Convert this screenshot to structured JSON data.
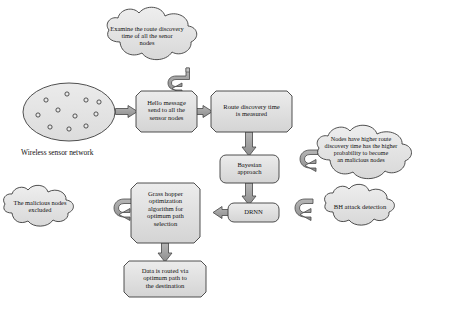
{
  "diagram": {
    "palette": {
      "fill_light": "#e3e3e3",
      "fill_mid": "#d2d2d2",
      "fill_dark": "#c0c0c0",
      "stroke": "#3c3c3c",
      "arrow_fill": "#9a9a9a",
      "text": "#111111",
      "page_bg": "#ffffff"
    },
    "network": {
      "shape": "ellipse",
      "caption": "Wireless sensor network",
      "node_count": 11,
      "nodes": [
        {
          "cx": 46,
          "cy": 100
        },
        {
          "cx": 67,
          "cy": 94
        },
        {
          "cx": 86,
          "cy": 100
        },
        {
          "cx": 99,
          "cy": 102
        },
        {
          "cx": 38,
          "cy": 115
        },
        {
          "cx": 58,
          "cy": 110
        },
        {
          "cx": 75,
          "cy": 116
        },
        {
          "cx": 96,
          "cy": 114
        },
        {
          "cx": 50,
          "cy": 127
        },
        {
          "cx": 69,
          "cy": 129
        },
        {
          "cx": 86,
          "cy": 126
        }
      ]
    },
    "clouds": [
      {
        "id": "examine-cloud",
        "name": "examine-route-discovery-cloud",
        "lines": [
          "Examine the route discovery",
          "time of all the senor",
          "nodes"
        ]
      },
      {
        "id": "higher-route-cloud",
        "name": "higher-route-discovery-cloud",
        "lines": [
          "Nodes have higher route",
          "discovery time has the higher",
          "probability to become",
          "an malicious nodes"
        ]
      },
      {
        "id": "bh-cloud",
        "name": "bh-attack-detection-cloud",
        "lines": [
          "BH attack detection"
        ]
      },
      {
        "id": "excluded-cloud",
        "name": "malicious-nodes-excluded-cloud",
        "lines": [
          "The malicious nodes",
          "excluded"
        ]
      }
    ],
    "process_boxes": [
      {
        "id": "hello-box",
        "name": "hello-message-box",
        "shape": "octagon",
        "lines": [
          "Hello message",
          "send to all the",
          "sensor nodes"
        ]
      },
      {
        "id": "route-box",
        "name": "route-discovery-time-box",
        "shape": "octagon",
        "lines": [
          "Route discovery time",
          "is measured"
        ]
      },
      {
        "id": "bayesian-box",
        "name": "bayesian-approach-box",
        "shape": "rounded-rect",
        "lines": [
          "Bayesian",
          "approach"
        ]
      },
      {
        "id": "drnn-box",
        "name": "drnn-box",
        "shape": "rounded-rect",
        "lines": [
          "DRNN"
        ]
      },
      {
        "id": "gho-box",
        "name": "grasshopper-optimization-box",
        "shape": "octagon",
        "lines": [
          "Grass hopper",
          "optimization",
          "algorithm for",
          "optimum path",
          "selection"
        ]
      },
      {
        "id": "routed-box",
        "name": "data-routed-box",
        "shape": "octagon",
        "lines": [
          "Data is routed via",
          "optimum path to",
          "the destination"
        ]
      }
    ],
    "connectors": [
      {
        "name": "arrow-network-to-hello",
        "kind": "straight",
        "direction": "right"
      },
      {
        "name": "arrow-hello-to-route",
        "kind": "straight",
        "direction": "right"
      },
      {
        "name": "arrow-examine-to-hello",
        "kind": "curved",
        "direction": "down-left"
      },
      {
        "name": "arrow-route-to-bayesian",
        "kind": "straight",
        "direction": "down"
      },
      {
        "name": "arrow-bayesian-to-drnn",
        "kind": "straight",
        "direction": "down"
      },
      {
        "name": "arrow-higher-route-to-bayesian",
        "kind": "curved",
        "direction": "left"
      },
      {
        "name": "arrow-bh-to-drnn",
        "kind": "curved",
        "direction": "left"
      },
      {
        "name": "arrow-drnn-to-grasshopper",
        "kind": "straight",
        "direction": "left"
      },
      {
        "name": "arrow-grasshopper-to-excluded",
        "kind": "curved",
        "direction": "left"
      },
      {
        "name": "arrow-grasshopper-to-routed",
        "kind": "straight",
        "direction": "down"
      }
    ]
  }
}
